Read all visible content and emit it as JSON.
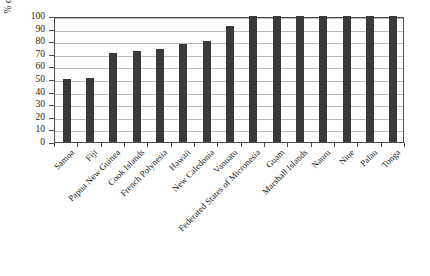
{
  "chart_data": {
    "type": "bar",
    "title": "",
    "xlabel": "",
    "ylabel": "% of electricity generated with diesel plants",
    "ylim": [
      0,
      100
    ],
    "ytick_step": 10,
    "yticks": [
      0,
      10,
      20,
      30,
      40,
      50,
      60,
      70,
      80,
      90,
      100
    ],
    "grid": true,
    "legend": false,
    "bar_color": "#3a3a3a",
    "axis_color": "#4d4d4d",
    "grid_color": "#b9b9b9",
    "categories": [
      "Samoa",
      "Fiji",
      "Papua New Guinea",
      "Cook Islands",
      "French Polynesia",
      "Hawaii",
      "New Caledonia",
      "Vanuatu",
      "Federated States of Micronesia",
      "Guam",
      "Marshall Islands",
      "Nauru",
      "Niue",
      "Palau",
      "Tonga"
    ],
    "values": [
      50,
      51,
      71,
      72,
      74,
      78,
      80,
      92,
      100,
      100,
      100,
      100,
      100,
      100,
      100
    ]
  }
}
